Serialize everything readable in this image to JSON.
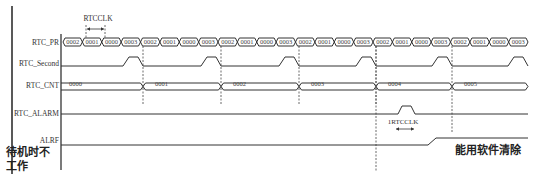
{
  "diagram": {
    "signals": [
      {
        "id": "pr",
        "label": "RTC_PR"
      },
      {
        "id": "second",
        "label": "RTC_Second"
      },
      {
        "id": "cnt",
        "label": "RTC_CNT"
      },
      {
        "id": "alarm",
        "label": "RTC_ALARM"
      },
      {
        "id": "alrf",
        "label": "ALRF"
      }
    ],
    "pr_values": [
      "0002",
      "0001",
      "0000",
      "0003",
      "0002",
      "0001",
      "0000",
      "0003",
      "0002",
      "0001",
      "0000",
      "0003",
      "0002",
      "0001",
      "0000",
      "0003",
      "0002",
      "0001",
      "0000",
      "0003",
      "0002",
      "0001",
      "0000",
      "0003"
    ],
    "cnt_values": [
      "0000",
      "0001",
      "0002",
      "0003",
      "0004",
      "0005"
    ],
    "annotations": {
      "rtcclk_top": "RTCCLK",
      "rtcclk_bottom": "1RTCCLK",
      "standby_note": "待机时不工作",
      "standby_line1": "待机时不",
      "standby_line2": "工作",
      "clear_note": "能用软件清除"
    }
  }
}
